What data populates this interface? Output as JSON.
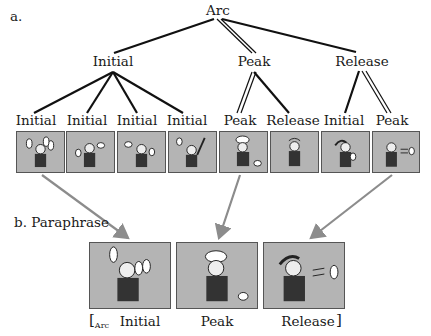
{
  "section_a": {
    "label": "a."
  },
  "section_b": {
    "label": "b. Paraphrase"
  },
  "tree": {
    "root": "Arc",
    "level1": [
      "Initial",
      "Peak",
      "Release"
    ],
    "level2": [
      "Initial",
      "Initial",
      "Initial",
      "Initial",
      "Peak",
      "Release",
      "Initial",
      "Peak"
    ],
    "head_edges_note": "double lines mark heads: Arc→Peak, Peak→Peak, Release→Peak"
  },
  "strip_panels": [
    {
      "scene": "juggler-many-pins"
    },
    {
      "scene": "juggler-pin-thrown"
    },
    {
      "scene": "juggler-pins-side"
    },
    {
      "scene": "juggler-arm-raised"
    },
    {
      "scene": "pin-hits-head"
    },
    {
      "scene": "dazed-reaction"
    },
    {
      "scene": "hand-on-head"
    },
    {
      "scene": "pin-flying-away"
    }
  ],
  "paraphrase": {
    "open_bracket": "[",
    "subscript": "Arc",
    "labels": [
      "Initial",
      "Peak",
      "Release"
    ],
    "close_bracket": "]"
  },
  "colors": {
    "panel_fill": "#b4b4b4",
    "arrow": "#8c8c8c",
    "line": "#111111"
  }
}
